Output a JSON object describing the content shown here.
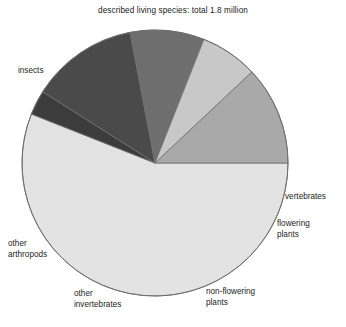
{
  "chart_data": {
    "type": "pie",
    "title": "described living species: total 1.8 million",
    "subtitle": "",
    "xlabel": "",
    "ylabel": "",
    "total": "1.8 million",
    "legend_position": "none",
    "grid": false,
    "labels_outside": true,
    "start_angle_deg": 0,
    "direction": "clockwise",
    "categories": [
      "insects",
      "vertebrates",
      "flowering plants",
      "non-flowering plants",
      "other invertebrates",
      "other arthropods"
    ],
    "values": [
      56,
      3,
      13,
      9,
      7,
      12
    ],
    "colors": [
      "#e3e3e3",
      "#3c3c3c",
      "#4a4a4a",
      "#6e6e6e",
      "#c8c8c8",
      "#a9a9a9"
    ],
    "slices": [
      {
        "label": "insects",
        "value": 56,
        "color": "#e3e3e3"
      },
      {
        "label": "vertebrates",
        "value": 3,
        "color": "#3c3c3c"
      },
      {
        "label": "flowering\nplants",
        "value": 13,
        "color": "#4a4a4a"
      },
      {
        "label": "non-flowering\nplants",
        "value": 9,
        "color": "#6e6e6e"
      },
      {
        "label": "other\ninvertebrates",
        "value": 7,
        "color": "#c8c8c8"
      },
      {
        "label": "other\narthropods",
        "value": 12,
        "color": "#a9a9a9"
      }
    ]
  },
  "figure": {
    "title": "described living species: total 1.8 million",
    "labels": {
      "insects": "insects",
      "vertebrates": "vertebrates",
      "flowering_plants": "flowering\nplants",
      "non_flowering_plants": "non-flowering\nplants",
      "other_invertebrates": "other\ninvertebrates",
      "other_arthropods": "other\narthropods"
    },
    "geometry": {
      "center_x": 155,
      "center_y": 163,
      "radius": 133
    },
    "colors": {
      "insects": "#e3e3e3",
      "vertebrates": "#3c3c3c",
      "flowering_plants": "#4a4a4a",
      "non_flowering_plants": "#6e6e6e",
      "other_invertebrates": "#c8c8c8",
      "other_arthropods": "#a9a9a9",
      "outline": "#6f6f6f",
      "background": "#ffffff"
    }
  }
}
